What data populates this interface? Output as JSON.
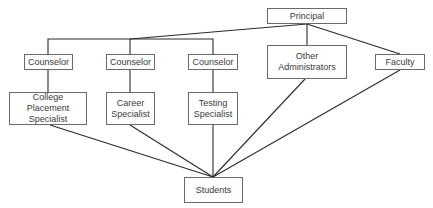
{
  "diagram": {
    "type": "organizational-chart",
    "nodes": {
      "principal": "Principal",
      "counselor_1": "Counselor",
      "counselor_2": "Counselor",
      "counselor_3": "Counselor",
      "other_admin_line1": "Other",
      "other_admin_line2": "Administrators",
      "faculty": "Faculty",
      "college_line1": "College Placement",
      "college_line2": "Specialist",
      "career_line1": "Career",
      "career_line2": "Specialist",
      "testing_line1": "Testing",
      "testing_line2": "Specialist",
      "students": "Students"
    },
    "edges": [
      [
        "Principal",
        "Counselor (1)"
      ],
      [
        "Principal",
        "Counselor (2)"
      ],
      [
        "Principal",
        "Counselor (3)"
      ],
      [
        "Principal",
        "Other Administrators"
      ],
      [
        "Principal",
        "Faculty"
      ],
      [
        "Counselor (1)",
        "College Placement Specialist"
      ],
      [
        "Counselor (2)",
        "Career Specialist"
      ],
      [
        "Counselor (3)",
        "Testing Specialist"
      ],
      [
        "College Placement Specialist",
        "Students"
      ],
      [
        "Career Specialist",
        "Students"
      ],
      [
        "Testing Specialist",
        "Students"
      ],
      [
        "Other Administrators",
        "Students"
      ],
      [
        "Faculty",
        "Students"
      ]
    ],
    "line_color": "#2a2a2a",
    "box_border_color": "#6a6a6a"
  },
  "caption": ""
}
